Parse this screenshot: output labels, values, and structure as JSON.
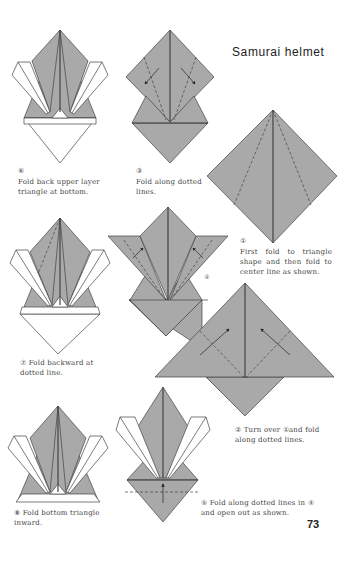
{
  "page": {
    "title": "Samurai helmet",
    "page_number": "73",
    "colors": {
      "paper": "#ffffff",
      "fold_grey": "#a9a9a9",
      "line": "#444444",
      "text": "#444444"
    }
  },
  "steps": [
    {
      "number": "①",
      "caption": "First fold to triangle shape and then fold to center line as shown."
    },
    {
      "number": "②",
      "caption": "Turn over ①and fold along dotted lines."
    },
    {
      "number": "③",
      "caption": "Fold along dotted lines."
    },
    {
      "number": "④",
      "caption": ""
    },
    {
      "number": "⑤",
      "caption": "Fold along dotted lines in ④ and open out as shown."
    },
    {
      "number": "⑥",
      "caption": "Fold back upper layer triangle at bottom."
    },
    {
      "number": "⑦",
      "caption": "Fold backward at dotted line."
    },
    {
      "number": "⑧",
      "caption": "Fold bottom triangle inward."
    }
  ]
}
